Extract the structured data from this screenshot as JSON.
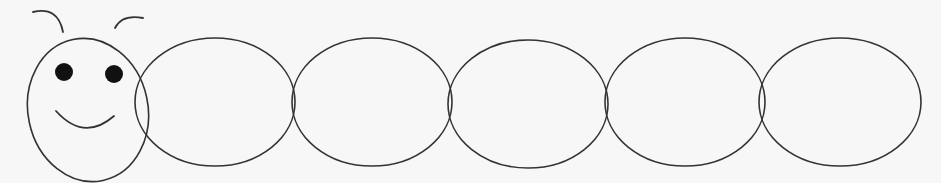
{
  "background": "#f7f7f7",
  "stroke_color": "#333333",
  "fill_color": "#f7f7f7",
  "eye_color": "#111111",
  "caterpillar": {
    "head": {
      "cx": 88,
      "cy": 110,
      "rx": 60,
      "ry": 72,
      "rotate": -12
    },
    "antennae": [
      {
        "d": "M33 12 Q58 6 63 32"
      },
      {
        "d": "M115 28 Q122 14 143 18"
      }
    ],
    "eyes": [
      {
        "cx": 64,
        "cy": 72,
        "r": 9
      },
      {
        "cx": 114,
        "cy": 74,
        "r": 9
      }
    ],
    "mouth": {
      "d": "M56 111 Q84 142 114 116"
    },
    "segments": [
      {
        "cx": 215,
        "cy": 102,
        "rx": 80,
        "ry": 64
      },
      {
        "cx": 372,
        "cy": 102,
        "rx": 80,
        "ry": 64
      },
      {
        "cx": 528,
        "cy": 104,
        "rx": 80,
        "ry": 64
      },
      {
        "cx": 685,
        "cy": 102,
        "rx": 80,
        "ry": 64
      },
      {
        "cx": 840,
        "cy": 102,
        "rx": 81,
        "ry": 64
      }
    ]
  }
}
